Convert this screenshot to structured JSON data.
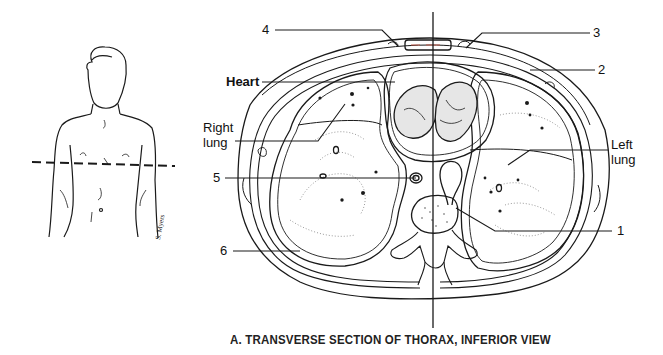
{
  "figure": {
    "caption": "A. TRANSVERSE SECTION OF THORAX, INFERIOR VIEW",
    "signature": "S. Myers",
    "labels": {
      "heart": "Heart",
      "right_lung_line1": "Right",
      "right_lung_line2": "lung",
      "left_lung_line1": "Left",
      "left_lung_line2": "lung",
      "n1": "1",
      "n2": "2",
      "n3": "3",
      "n4": "4",
      "n5": "5",
      "n6": "6"
    },
    "colors": {
      "ink": "#1a1a1a",
      "background": "#ffffff",
      "skin_tint": "#d98a7a"
    }
  }
}
